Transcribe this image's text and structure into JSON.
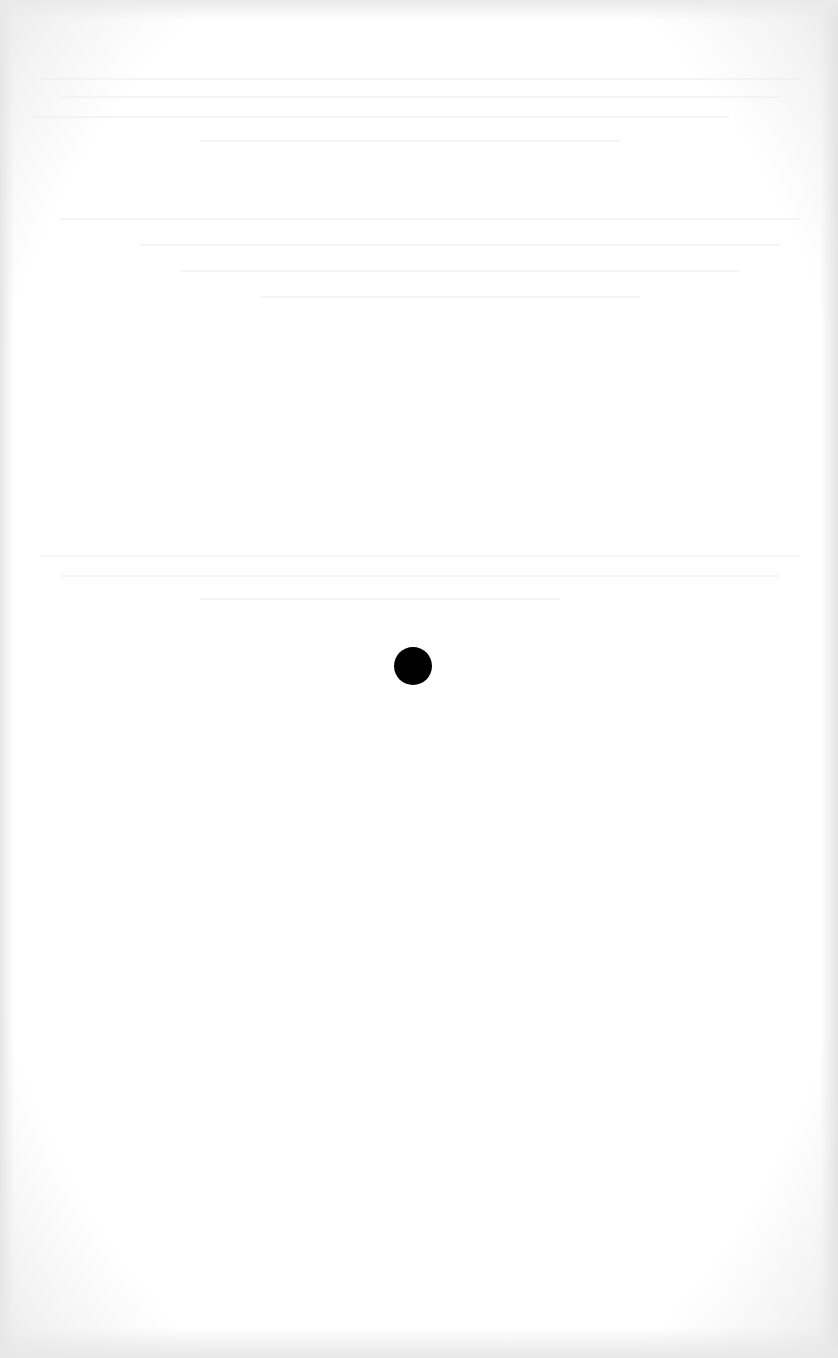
{
  "page": {
    "background_color": "#ffffff",
    "margin_shading_color": "#e8e8e8"
  },
  "marks": [
    {
      "type": "dot",
      "center_x": 413,
      "center_y": 666,
      "diameter": 38,
      "color": "#000000"
    }
  ],
  "show_through_text_lines": [
    {
      "x": 40,
      "y": 78,
      "w": 760
    },
    {
      "x": 60,
      "y": 96,
      "w": 720
    },
    {
      "x": 30,
      "y": 116,
      "w": 700
    },
    {
      "x": 200,
      "y": 140,
      "w": 420
    },
    {
      "x": 60,
      "y": 218,
      "w": 740
    },
    {
      "x": 140,
      "y": 244,
      "w": 640
    },
    {
      "x": 180,
      "y": 270,
      "w": 560
    },
    {
      "x": 260,
      "y": 296,
      "w": 380
    },
    {
      "x": 40,
      "y": 555,
      "w": 760
    },
    {
      "x": 60,
      "y": 575,
      "w": 720
    },
    {
      "x": 200,
      "y": 598,
      "w": 360
    }
  ]
}
